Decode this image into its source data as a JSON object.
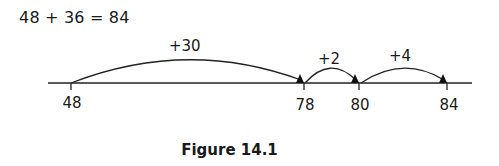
{
  "equation": "48 + 36 = 84",
  "number_line": {
    "ticks": [
      {
        "value": "48",
        "x": 71
      },
      {
        "value": "78",
        "x": 304
      },
      {
        "value": "80",
        "x": 359
      },
      {
        "value": "84",
        "x": 447
      }
    ],
    "jumps": [
      {
        "label": "+30",
        "from": "48",
        "to": "78"
      },
      {
        "label": "+2",
        "from": "78",
        "to": "80"
      },
      {
        "label": "+4",
        "from": "80",
        "to": "84"
      }
    ]
  },
  "caption": "Figure 14.1"
}
